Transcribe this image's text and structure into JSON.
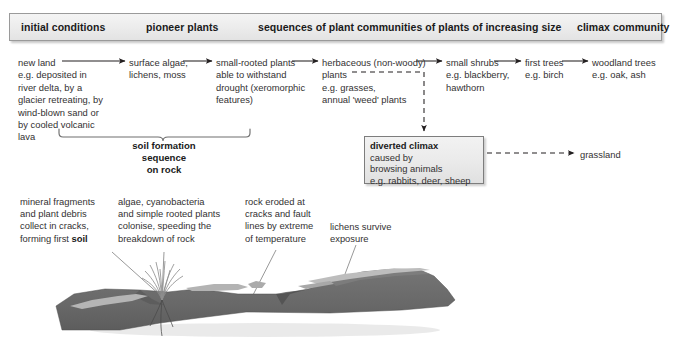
{
  "banner": {
    "stage_initial": "initial conditions",
    "stage_pioneer": "pioneer plants",
    "stage_sequences": "sequences of plant communities of plants of increasing size",
    "stage_climax": "climax community"
  },
  "succession": {
    "step1": "new land\ne.g. deposited in\nriver delta, by a\nglacier retreating, by\nwind-blown sand or\nby cooled volcanic\nlava",
    "step2": "surface algae,\nlichens, moss",
    "step3": "small-rooted plants\nable to withstand\ndrought (xeromorphic\nfeatures)",
    "step4": "herbaceous (non-woody)\nplants\ne.g. grasses,\nannual 'weed' plants",
    "step5": "small shrubs\ne.g. blackberry,\nhawthorn",
    "step6": "first trees\ne.g. birch",
    "step7": "woodland trees\ne.g. oak, ash"
  },
  "bracket": {
    "label": "soil formation\nsequence\non rock"
  },
  "diverted_climax": {
    "title": "diverted climax",
    "body": "caused by\nbrowsing animals\ne.g. rabbits, deer, sheep",
    "outcome": "grassland"
  },
  "callouts": {
    "soil_part1": "mineral fragments\nand plant debris\ncollect in cracks,\nforming first ",
    "soil_bold": "soil",
    "algae": "algae, cyanobacteria\nand simple rooted plants\ncolonise, speeding the\nbreakdown of rock",
    "erosion": "rock eroded at\ncracks and fault\nlines by extreme\nof temperature",
    "lichens": "lichens survive\nexposure"
  },
  "illustration": {
    "rock_name": "rock-outcrop",
    "rock_color": "#6e6e6e",
    "rock_shadow_color": "#5a5a5a",
    "lichen_color": "#b3b3b3",
    "grass_color": "#8a8a8a"
  },
  "colors": {
    "banner_fill": "#ededed",
    "banner_border": "#9a9a9a",
    "text": "#333132",
    "heading": "#1a1a1a",
    "arrow": "#231f20"
  }
}
